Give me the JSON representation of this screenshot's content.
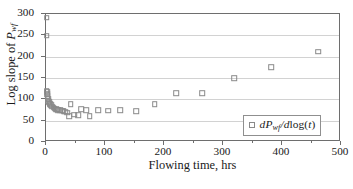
{
  "chart_data": {
    "type": "scatter",
    "title": "",
    "xlabel": "Flowing time, hrs",
    "ylabel": "Log slope of Pwf",
    "xlim": [
      0,
      500
    ],
    "ylim": [
      0,
      300
    ],
    "grid": true,
    "legend_position": "bottom-right",
    "series": [
      {
        "name": "dPwf/dlog(t)",
        "marker": "open-square",
        "marker_color": "#8a8a8a",
        "points": [
          [
            1,
            291
          ],
          [
            1,
            249
          ],
          [
            1,
            120
          ],
          [
            2,
            117
          ],
          [
            2,
            112
          ],
          [
            3,
            108
          ],
          [
            3,
            103
          ],
          [
            4,
            100
          ],
          [
            4,
            96
          ],
          [
            5,
            93
          ],
          [
            6,
            90
          ],
          [
            7,
            88
          ],
          [
            9,
            86
          ],
          [
            11,
            83
          ],
          [
            13,
            80
          ],
          [
            15,
            78
          ],
          [
            17,
            77
          ],
          [
            19,
            76
          ],
          [
            21,
            75
          ],
          [
            24,
            74
          ],
          [
            27,
            73
          ],
          [
            30,
            72
          ],
          [
            33,
            71
          ],
          [
            36,
            69
          ],
          [
            39,
            60
          ],
          [
            42,
            88
          ],
          [
            48,
            64
          ],
          [
            55,
            63
          ],
          [
            60,
            77
          ],
          [
            68,
            74
          ],
          [
            74,
            61
          ],
          [
            88,
            75
          ],
          [
            105,
            73
          ],
          [
            126,
            75
          ],
          [
            153,
            72
          ],
          [
            184,
            88
          ],
          [
            221,
            114
          ],
          [
            265,
            114
          ],
          [
            319,
            150
          ],
          [
            382,
            175
          ],
          [
            461,
            212
          ]
        ]
      }
    ],
    "yticks": [
      0,
      50,
      100,
      150,
      200,
      250,
      300
    ],
    "xticks": [
      0,
      100,
      200,
      300,
      400,
      500
    ],
    "xticks_minor": [
      50,
      150,
      250,
      350,
      450
    ],
    "colors": {
      "marker": "#8a8a8a",
      "gridline": "#d2d2d2",
      "axis": "#6e6e6e",
      "text": "#1a1a1a",
      "background": "#ffffff"
    }
  },
  "axes": {
    "x_title": "Flowing time, hrs",
    "y_title_prefix": "Log slope of ",
    "y_title_symbol": "P",
    "y_title_subscript": "wf"
  },
  "legend": {
    "entry_prefix": "d",
    "entry_symbol": "P",
    "entry_subscript": "wf",
    "entry_divider": "/d",
    "entry_func": "log(",
    "entry_var": "t",
    "entry_close": ")",
    "entry_full": "dPwf/dlog(t)"
  }
}
